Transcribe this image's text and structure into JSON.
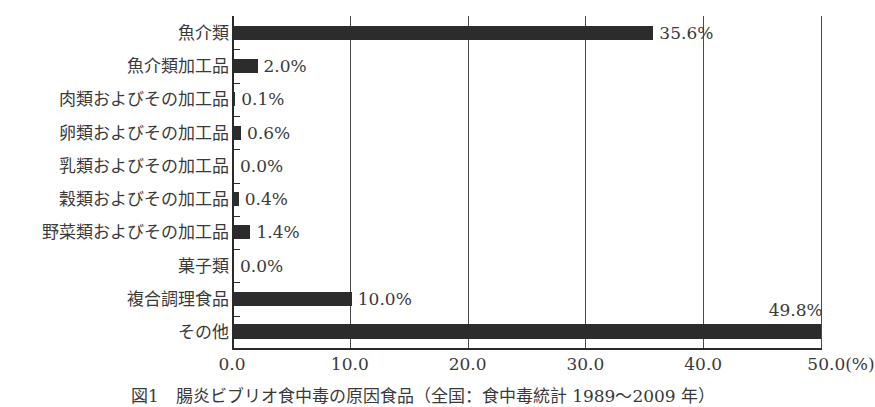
{
  "chart_data": {
    "type": "bar",
    "orientation": "horizontal",
    "title": "図1　腸炎ビブリオ食中毒の原因食品（全国：食中毒統計 1989～2009 年）",
    "xlabel": "(%)",
    "ylabel": "",
    "xlim": [
      0,
      50
    ],
    "x_ticks": [
      "0.0",
      "10.0",
      "20.0",
      "30.0",
      "40.0",
      "50.0(%)"
    ],
    "grid": "vertical",
    "legend": null,
    "categories": [
      "魚介類",
      "魚介類加工品",
      "肉類およびその加工品",
      "卵類およびその加工品",
      "乳類およびその加工品",
      "穀類およびその加工品",
      "野菜類およびその加工品",
      "菓子類",
      "複合調理食品",
      "その他"
    ],
    "values": [
      35.6,
      2.0,
      0.1,
      0.6,
      0.0,
      0.4,
      1.4,
      0.0,
      10.0,
      49.8
    ],
    "value_labels": [
      "35.6%",
      "2.0%",
      "0.1%",
      "0.6%",
      "0.0%",
      "0.4%",
      "1.4%",
      "0.0%",
      "10.0%",
      "49.8%"
    ],
    "bar_color": "#2c2c2c"
  }
}
